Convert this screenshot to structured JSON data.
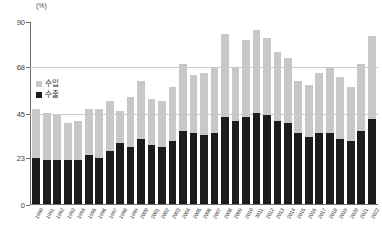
{
  "chart_data": {
    "type": "bar",
    "stacked": true,
    "title": "",
    "subtitle": "",
    "xlabel": "",
    "ylabel": "(%)",
    "unit": "(%)",
    "ylim": [
      0,
      90
    ],
    "yticks": [
      0,
      23,
      45,
      68,
      90
    ],
    "ytick_labels": [
      "0",
      "23",
      "45",
      "68",
      "90"
    ],
    "grid": true,
    "gridlines_at": [
      45,
      68
    ],
    "legend_position": "inside-left",
    "categories": [
      "1990",
      "1991",
      "1992",
      "1993",
      "1994",
      "1995",
      "1996",
      "1997",
      "1998",
      "1999",
      "2000",
      "2001",
      "2002",
      "2003",
      "2004",
      "2005",
      "2006",
      "2007",
      "2008",
      "2009",
      "2010",
      "2011",
      "2012",
      "2013",
      "2014",
      "2015",
      "2016",
      "2017",
      "2018",
      "2019",
      "2020",
      "2021",
      "2022"
    ],
    "series": [
      {
        "name": "수출",
        "color": "#1c1c1c",
        "values": [
          23,
          22,
          22,
          22,
          22,
          24,
          23,
          26,
          30,
          28,
          32,
          29,
          28,
          31,
          36,
          35,
          34,
          35,
          43,
          41,
          43,
          45,
          44,
          41,
          40,
          35,
          33,
          35,
          35,
          32,
          31,
          36,
          42
        ]
      },
      {
        "name": "수입",
        "color": "#c8c8c8",
        "values": [
          24,
          23,
          22,
          18,
          19,
          23,
          24,
          25,
          16,
          25,
          29,
          23,
          23,
          27,
          33,
          29,
          31,
          33,
          41,
          27,
          38,
          41,
          38,
          34,
          32,
          26,
          26,
          30,
          33,
          31,
          27,
          33,
          41
        ]
      }
    ],
    "totals": [
      47,
      45,
      44,
      40,
      41,
      47,
      47,
      51,
      46,
      53,
      61,
      52,
      51,
      58,
      69,
      64,
      65,
      68,
      84,
      68,
      81,
      86,
      82,
      75,
      72,
      61,
      59,
      65,
      68,
      63,
      58,
      69,
      83
    ]
  },
  "legend": {
    "items": [
      {
        "label": "수입",
        "color": "#c8c8c8"
      },
      {
        "label": "수출",
        "color": "#1c1c1c"
      }
    ]
  },
  "axis": {
    "unit": "(%)"
  }
}
